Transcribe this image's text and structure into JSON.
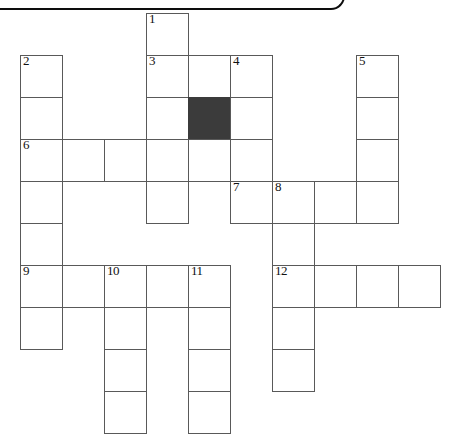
{
  "puzzle": {
    "type": "crossword-grid",
    "title": "Crossword puzzle grid",
    "geometry": {
      "cell_size": 43,
      "origin_x": 20,
      "origin_y": 13,
      "columns": 10,
      "rows": 10
    },
    "colors": {
      "cell_fill": "#ffffff",
      "cell_border": "#595959",
      "blocked_fill": "#3b3b3b",
      "number_text": "#111111",
      "frame_edge": "#0d0d0d"
    },
    "clue_numbers": [
      "1",
      "2",
      "3",
      "4",
      "5",
      "6",
      "7",
      "8",
      "9",
      "10",
      "11",
      "12"
    ],
    "cells": [
      {
        "row": 0,
        "col": 3,
        "number": "1",
        "blocked": false
      },
      {
        "row": 1,
        "col": 0,
        "number": "2",
        "blocked": false
      },
      {
        "row": 1,
        "col": 3,
        "number": "3",
        "blocked": false
      },
      {
        "row": 1,
        "col": 4,
        "number": "",
        "blocked": false
      },
      {
        "row": 1,
        "col": 5,
        "number": "4",
        "blocked": false
      },
      {
        "row": 1,
        "col": 8,
        "number": "5",
        "blocked": false
      },
      {
        "row": 2,
        "col": 0,
        "number": "",
        "blocked": false
      },
      {
        "row": 2,
        "col": 3,
        "number": "",
        "blocked": false
      },
      {
        "row": 2,
        "col": 4,
        "number": "",
        "blocked": true
      },
      {
        "row": 2,
        "col": 5,
        "number": "",
        "blocked": false
      },
      {
        "row": 2,
        "col": 8,
        "number": "",
        "blocked": false
      },
      {
        "row": 3,
        "col": 0,
        "number": "6",
        "blocked": false
      },
      {
        "row": 3,
        "col": 1,
        "number": "",
        "blocked": false
      },
      {
        "row": 3,
        "col": 2,
        "number": "",
        "blocked": false
      },
      {
        "row": 3,
        "col": 3,
        "number": "",
        "blocked": false
      },
      {
        "row": 3,
        "col": 4,
        "number": "",
        "blocked": false
      },
      {
        "row": 3,
        "col": 5,
        "number": "",
        "blocked": false
      },
      {
        "row": 3,
        "col": 8,
        "number": "",
        "blocked": false
      },
      {
        "row": 4,
        "col": 0,
        "number": "",
        "blocked": false
      },
      {
        "row": 4,
        "col": 3,
        "number": "",
        "blocked": false
      },
      {
        "row": 4,
        "col": 5,
        "number": "7",
        "blocked": false
      },
      {
        "row": 4,
        "col": 6,
        "number": "8",
        "blocked": false
      },
      {
        "row": 4,
        "col": 7,
        "number": "",
        "blocked": false
      },
      {
        "row": 4,
        "col": 8,
        "number": "",
        "blocked": false
      },
      {
        "row": 5,
        "col": 0,
        "number": "",
        "blocked": false
      },
      {
        "row": 5,
        "col": 6,
        "number": "",
        "blocked": false
      },
      {
        "row": 6,
        "col": 0,
        "number": "9",
        "blocked": false
      },
      {
        "row": 6,
        "col": 1,
        "number": "",
        "blocked": false
      },
      {
        "row": 6,
        "col": 2,
        "number": "10",
        "blocked": false
      },
      {
        "row": 6,
        "col": 3,
        "number": "",
        "blocked": false
      },
      {
        "row": 6,
        "col": 4,
        "number": "11",
        "blocked": false
      },
      {
        "row": 6,
        "col": 6,
        "number": "12",
        "blocked": false
      },
      {
        "row": 6,
        "col": 7,
        "number": "",
        "blocked": false
      },
      {
        "row": 6,
        "col": 8,
        "number": "",
        "blocked": false
      },
      {
        "row": 6,
        "col": 9,
        "number": "",
        "blocked": false
      },
      {
        "row": 7,
        "col": 0,
        "number": "",
        "blocked": false
      },
      {
        "row": 7,
        "col": 2,
        "number": "",
        "blocked": false
      },
      {
        "row": 7,
        "col": 4,
        "number": "",
        "blocked": false
      },
      {
        "row": 7,
        "col": 6,
        "number": "",
        "blocked": false
      },
      {
        "row": 8,
        "col": 2,
        "number": "",
        "blocked": false
      },
      {
        "row": 8,
        "col": 4,
        "number": "",
        "blocked": false
      },
      {
        "row": 8,
        "col": 6,
        "number": "",
        "blocked": false
      },
      {
        "row": 9,
        "col": 2,
        "number": "",
        "blocked": false
      },
      {
        "row": 9,
        "col": 4,
        "number": "",
        "blocked": false
      }
    ]
  }
}
